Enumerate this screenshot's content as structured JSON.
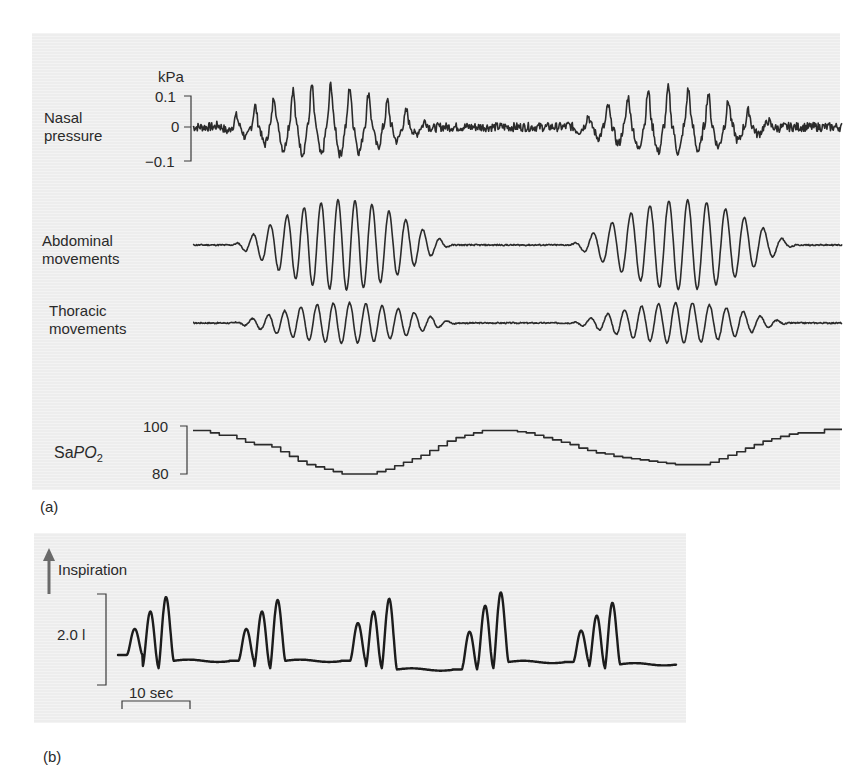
{
  "figure": {
    "panel_a_label": "(a)",
    "panel_b_label": "(b)"
  },
  "chart_data": [
    {
      "type": "line",
      "panel": "a",
      "title": "Nasal pressure",
      "label_lines": [
        "Nasal",
        "pressure"
      ],
      "unit": "kPa",
      "yticks": [
        {
          "value": 0.1,
          "label": "0.1"
        },
        {
          "value": 0,
          "label": "0"
        },
        {
          "value": -0.1,
          "label": "−0.1"
        }
      ],
      "ylim": [
        -0.1,
        0.1
      ],
      "description": "Two crescendo-decrescendo bursts of oscillation separated by near-flat apnoea",
      "bursts": [
        {
          "start": 0.03,
          "end": 0.38,
          "cycles": 12,
          "peak_amplitude": 0.11
        },
        {
          "start": 0.57,
          "end": 0.91,
          "cycles": 11,
          "peak_amplitude": 0.1
        }
      ]
    },
    {
      "type": "line",
      "panel": "a",
      "title": "Abdominal movements",
      "label_lines": [
        "Abdominal",
        "movements"
      ],
      "description": "Waxing-waning oscillation bursts aligned with nasal pressure",
      "bursts": [
        {
          "start": 0.06,
          "end": 0.4,
          "cycles": 13,
          "peak_amplitude": 1.0
        },
        {
          "start": 0.58,
          "end": 0.93,
          "cycles": 12,
          "peak_amplitude": 1.0
        }
      ]
    },
    {
      "type": "line",
      "panel": "a",
      "title": "Thoracic movements",
      "label_lines": [
        "Thoracic",
        "movements"
      ],
      "description": "Smaller waxing-waning oscillation bursts aligned with abdominal movements",
      "bursts": [
        {
          "start": 0.06,
          "end": 0.41,
          "cycles": 14,
          "peak_amplitude": 0.45
        },
        {
          "start": 0.58,
          "end": 0.92,
          "cycles": 13,
          "peak_amplitude": 0.45
        }
      ]
    },
    {
      "type": "line",
      "panel": "a",
      "title": "SaPO2",
      "label_prefix": "Sa",
      "label_italic": "PO",
      "label_sub": "2",
      "yticks": [
        {
          "value": 100,
          "label": "100"
        },
        {
          "value": 80,
          "label": "80"
        }
      ],
      "ylim": [
        80,
        100
      ],
      "steps": [
        98.5,
        98.5,
        97.5,
        96.5,
        96.5,
        95,
        93.5,
        92.5,
        92.5,
        91.5,
        89.5,
        87.5,
        85.5,
        84,
        83,
        82,
        81,
        80,
        80,
        80,
        80,
        81,
        82,
        83.5,
        85,
        86.5,
        88,
        90,
        92,
        94,
        95.5,
        96.5,
        97.5,
        98.5,
        98.5,
        98.5,
        98.5,
        98,
        97.5,
        96.5,
        95.5,
        94.5,
        93.5,
        92.5,
        91,
        90,
        89,
        88.5,
        87.5,
        87,
        86.5,
        86,
        85.5,
        85,
        84.5,
        84,
        84,
        84,
        84,
        85,
        86.5,
        88,
        89.5,
        91,
        92.5,
        94,
        95,
        96,
        97,
        97.5,
        97.5,
        97.5,
        99,
        99
      ]
    },
    {
      "type": "line",
      "panel": "b",
      "title": "Cheyne-Stokes respiration volume trace",
      "direction_label": "Inspiration",
      "yscale_label": "2.0 l",
      "xscale_label": "10 sec",
      "description": "Five clusters of three breaths of increasing amplitude separated by flat pauses",
      "clusters": [
        {
          "peaks": [
            0.45,
            0.75,
            1.0
          ],
          "baseline": 0.0,
          "pause_baseline": -0.1
        },
        {
          "peaks": [
            0.45,
            0.75,
            0.95
          ],
          "baseline": -0.1,
          "pause_baseline": -0.1
        },
        {
          "peaks": [
            0.55,
            0.75,
            0.97
          ],
          "baseline": -0.1,
          "pause_baseline": -0.25
        },
        {
          "peaks": [
            0.4,
            0.85,
            1.08
          ],
          "baseline": -0.25,
          "pause_baseline": -0.12
        },
        {
          "peaks": [
            0.42,
            0.68,
            0.9
          ],
          "baseline": -0.12,
          "pause_baseline": -0.16
        }
      ]
    }
  ]
}
